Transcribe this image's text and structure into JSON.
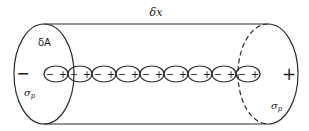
{
  "diagram": {
    "type": "cylinder-with-dipole-chain",
    "length_label": "δx",
    "left_face": {
      "area_label": "δA",
      "charge_sign": "−",
      "surface_charge_label": "σ",
      "surface_charge_sub": "p"
    },
    "right_face": {
      "charge_sign": "+",
      "surface_charge_label": "σ",
      "surface_charge_sub": "p"
    },
    "dipoles": {
      "count": 9,
      "items": [
        {
          "neg": "−",
          "pos": "+"
        },
        {
          "neg": "−",
          "pos": "+"
        },
        {
          "neg": "−",
          "pos": "+"
        },
        {
          "neg": "−",
          "pos": "+"
        },
        {
          "neg": "−",
          "pos": "+"
        },
        {
          "neg": "−",
          "pos": "+"
        },
        {
          "neg": "−",
          "pos": "+"
        },
        {
          "neg": "−",
          "pos": "+"
        },
        {
          "neg": "−",
          "pos": "+"
        }
      ]
    },
    "colors": {
      "line": "#2a2a2a",
      "background": "#ffffff"
    }
  }
}
